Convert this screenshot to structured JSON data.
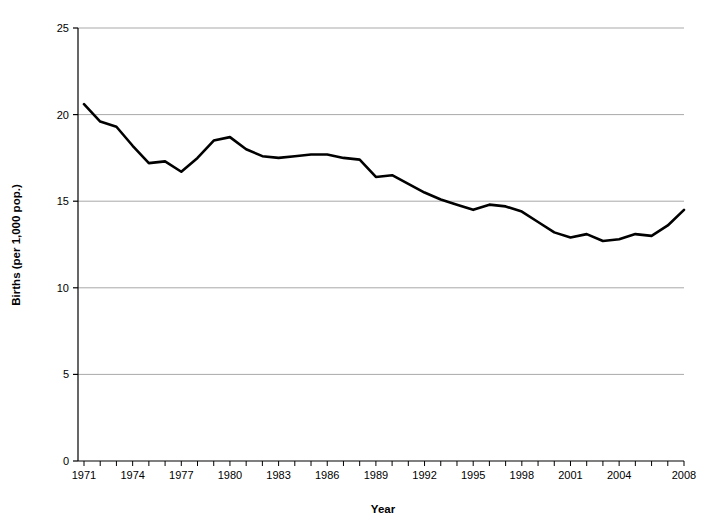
{
  "chart_data": {
    "type": "line",
    "title": "",
    "xlabel": "Year",
    "ylabel": "Births (per 1,000 pop.)",
    "xlim": [
      1971,
      2008
    ],
    "ylim": [
      0,
      25
    ],
    "grid": true,
    "legend": "none",
    "y_ticks": [
      0,
      5,
      10,
      15,
      20,
      25
    ],
    "y_tick_labels": [
      "0",
      "5",
      "10",
      "15",
      "20",
      "25"
    ],
    "x_tick_labels": [
      "1971",
      "1974",
      "1977",
      "1980",
      "1983",
      "1986",
      "1989",
      "1992",
      "1995",
      "1998",
      "2001",
      "2004",
      "2008"
    ],
    "x_tick_label_years": [
      1971,
      1974,
      1977,
      1980,
      1983,
      1986,
      1989,
      1992,
      1995,
      1998,
      2001,
      2004,
      2008
    ],
    "x_minor_tick_years": [
      1971,
      1972,
      1973,
      1974,
      1975,
      1976,
      1977,
      1978,
      1979,
      1980,
      1981,
      1982,
      1983,
      1984,
      1985,
      1986,
      1987,
      1988,
      1989,
      1990,
      1991,
      1992,
      1993,
      1994,
      1995,
      1996,
      1997,
      1998,
      1999,
      2000,
      2001,
      2002,
      2003,
      2004,
      2005,
      2006,
      2007,
      2008
    ],
    "line_color": "#000000",
    "line_width": 2.6,
    "grid_color": "#a9a9a9",
    "axis_color": "#000000",
    "x": [
      1971,
      1972,
      1973,
      1974,
      1975,
      1976,
      1977,
      1978,
      1979,
      1980,
      1981,
      1982,
      1983,
      1984,
      1985,
      1986,
      1987,
      1988,
      1989,
      1990,
      1991,
      1992,
      1993,
      1994,
      1995,
      1996,
      1997,
      1998,
      1999,
      2000,
      2001,
      2002,
      2003,
      2004,
      2005,
      2006,
      2007,
      2008
    ],
    "series": [
      {
        "name": "Births per 1,000 population",
        "values": [
          20.6,
          19.6,
          19.3,
          18.2,
          17.2,
          17.3,
          16.7,
          17.5,
          18.5,
          18.7,
          18.0,
          17.6,
          17.5,
          17.6,
          17.7,
          17.7,
          17.5,
          17.4,
          16.4,
          16.5,
          16.0,
          15.5,
          15.1,
          14.8,
          14.5,
          14.8,
          14.7,
          14.4,
          13.8,
          13.2,
          12.9,
          13.1,
          12.7,
          12.8,
          13.1,
          13.0,
          13.6,
          14.5
        ]
      }
    ]
  },
  "figure": {
    "background": "#ffffff"
  }
}
